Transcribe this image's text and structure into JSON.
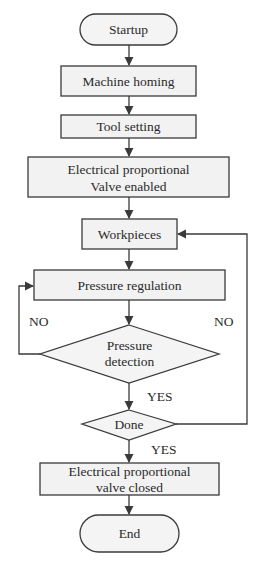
{
  "diagram": {
    "type": "flowchart",
    "nodes": {
      "startup": {
        "label": "Startup",
        "shape": "terminal"
      },
      "machine_homing": {
        "label": "Machine homing",
        "shape": "process"
      },
      "tool_setting": {
        "label": "Tool setting",
        "shape": "process"
      },
      "valve_enabled": {
        "line1": "Electrical proportional",
        "line2": "Valve enabled",
        "shape": "process"
      },
      "workpieces": {
        "label": "Workpieces",
        "shape": "process"
      },
      "pressure_regulation": {
        "label": "Pressure regulation",
        "shape": "process"
      },
      "pressure_detection": {
        "line1": "Pressure",
        "line2": "detection",
        "shape": "decision"
      },
      "done": {
        "label": "Done",
        "shape": "decision"
      },
      "valve_closed": {
        "line1": "Electrical proportional",
        "line2": "valve closed",
        "shape": "process"
      },
      "end": {
        "label": "End",
        "shape": "terminal"
      }
    },
    "edge_labels": {
      "pressure_detection_no": "NO",
      "done_no": "NO",
      "pressure_detection_yes": "YES",
      "done_yes": "YES"
    },
    "edges": [
      {
        "from": "startup",
        "to": "machine_homing"
      },
      {
        "from": "machine_homing",
        "to": "tool_setting"
      },
      {
        "from": "tool_setting",
        "to": "valve_enabled"
      },
      {
        "from": "valve_enabled",
        "to": "workpieces"
      },
      {
        "from": "workpieces",
        "to": "pressure_regulation"
      },
      {
        "from": "pressure_regulation",
        "to": "pressure_detection"
      },
      {
        "from": "pressure_detection",
        "to": "pressure_regulation",
        "label": "NO"
      },
      {
        "from": "pressure_detection",
        "to": "done",
        "label": "YES"
      },
      {
        "from": "done",
        "to": "workpieces",
        "label": "NO"
      },
      {
        "from": "done",
        "to": "valve_closed",
        "label": "YES"
      },
      {
        "from": "valve_closed",
        "to": "end"
      }
    ]
  }
}
